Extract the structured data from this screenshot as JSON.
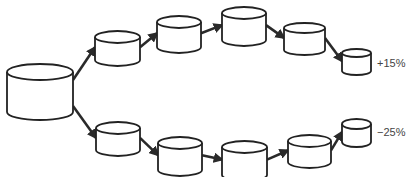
{
  "diagram": {
    "colors": {
      "stroke": "#222222",
      "fill": "#ffffff",
      "label": "#444444"
    },
    "source": {
      "id": "source",
      "x": 7,
      "y": 72,
      "w": 66,
      "h": 40,
      "ry": 8
    },
    "branches": [
      {
        "name": "upper",
        "label": "+15%",
        "label_pos": {
          "x": 377,
          "y": 67
        },
        "nodes": [
          {
            "x": 95,
            "y": 37,
            "w": 45,
            "h": 23,
            "ry": 6
          },
          {
            "x": 157,
            "y": 22,
            "w": 44,
            "h": 25,
            "ry": 6
          },
          {
            "x": 222,
            "y": 13,
            "w": 44,
            "h": 27,
            "ry": 6
          },
          {
            "x": 284,
            "y": 28,
            "w": 41,
            "h": 22,
            "ry": 5
          },
          {
            "x": 342,
            "y": 53,
            "w": 29,
            "h": 18,
            "ry": 4
          }
        ]
      },
      {
        "name": "lower",
        "label": "−25%",
        "label_pos": {
          "x": 377,
          "y": 136
        },
        "nodes": [
          {
            "x": 96,
            "y": 128,
            "w": 44,
            "h": 22,
            "ry": 6
          },
          {
            "x": 158,
            "y": 143,
            "w": 44,
            "h": 27,
            "ry": 6
          },
          {
            "x": 222,
            "y": 147,
            "w": 45,
            "h": 28,
            "ry": 6
          },
          {
            "x": 288,
            "y": 141,
            "w": 43,
            "h": 21,
            "ry": 6
          },
          {
            "x": 342,
            "y": 124,
            "w": 29,
            "h": 18,
            "ry": 5
          }
        ]
      }
    ]
  }
}
